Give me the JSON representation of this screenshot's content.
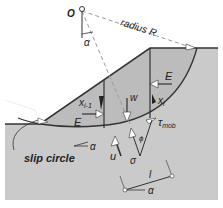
{
  "diagram": {
    "labels": {
      "center": "O",
      "radius": "radius R",
      "alpha_top": "α",
      "E_right": "E",
      "x_i": "x",
      "x_i_sub": "i",
      "x_i1": "x",
      "x_i1_sub": "i-1",
      "W": "w",
      "E_left": "E",
      "tau": "τ",
      "tau_sub": "mob",
      "phi": "ϕ",
      "u": "u",
      "sigma": "σ",
      "alpha_mid": "α",
      "slip_circle": "slip circle",
      "l": "l",
      "alpha_bottom": "α"
    },
    "colors": {
      "soil": "#c9c9c9",
      "slice": "#b9b9b9",
      "line": "#333333",
      "dashed": "#9a9a9a",
      "arrow_fill": "#ffffff"
    }
  }
}
